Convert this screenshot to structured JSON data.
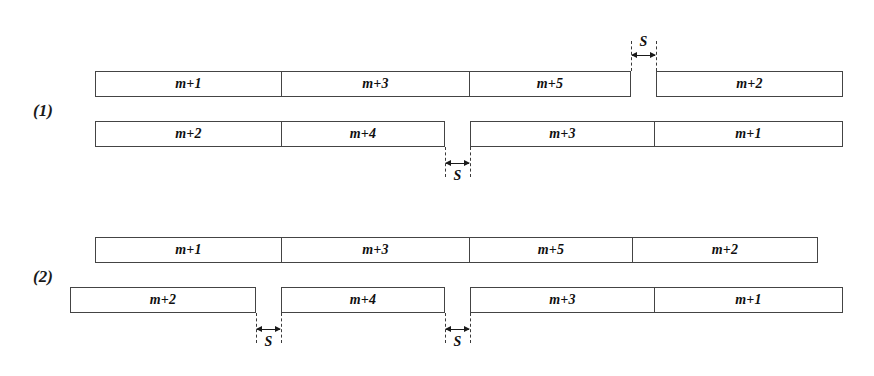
{
  "figure": {
    "width": 874,
    "height": 376,
    "background": "#ffffff",
    "line_color": "#444444",
    "text_color": "#101010",
    "gap_symbol": "S"
  },
  "groups": [
    {
      "label": "(1)",
      "label_x": 33,
      "label_y": 101,
      "rows": [
        {
          "name": "row-1",
          "y": 71,
          "height": 26,
          "cells": [
            {
              "label": "m+1",
              "x": 95,
              "w": 187
            },
            {
              "label": "m+3",
              "x": 282,
              "w": 188
            },
            {
              "label": "m+5",
              "x": 470,
              "w": 161
            },
            {
              "label": "m+2",
              "x": 656,
              "w": 187
            }
          ],
          "gaps": [
            {
              "label": "S",
              "x": 631,
              "w": 25,
              "side": "above"
            }
          ]
        },
        {
          "name": "row-2",
          "y": 121,
          "height": 26,
          "cells": [
            {
              "label": "m+2",
              "x": 95,
              "w": 187
            },
            {
              "label": "m+4",
              "x": 282,
              "w": 163
            },
            {
              "label": "m+3",
              "x": 470,
              "w": 185
            },
            {
              "label": "m+1",
              "x": 655,
              "w": 188
            }
          ],
          "gaps": [
            {
              "label": "S",
              "x": 445,
              "w": 25,
              "side": "below"
            }
          ]
        }
      ]
    },
    {
      "label": "(2)",
      "label_x": 33,
      "label_y": 267,
      "rows": [
        {
          "name": "row-1",
          "y": 237,
          "height": 26,
          "cells": [
            {
              "label": "m+1",
              "x": 95,
              "w": 187
            },
            {
              "label": "m+3",
              "x": 282,
              "w": 188
            },
            {
              "label": "m+5",
              "x": 470,
              "w": 163
            },
            {
              "label": "m+2",
              "x": 633,
              "w": 185
            }
          ],
          "gaps": []
        },
        {
          "name": "row-2",
          "y": 287,
          "height": 26,
          "cells": [
            {
              "label": "m+2",
              "x": 70,
              "w": 186
            },
            {
              "label": "m+4",
              "x": 281,
              "w": 164
            },
            {
              "label": "m+3",
              "x": 470,
              "w": 185
            },
            {
              "label": "m+1",
              "x": 655,
              "w": 188
            }
          ],
          "gaps": [
            {
              "label": "S",
              "x": 256,
              "w": 25,
              "side": "below"
            },
            {
              "label": "S",
              "x": 445,
              "w": 25,
              "side": "below"
            }
          ]
        }
      ]
    }
  ]
}
